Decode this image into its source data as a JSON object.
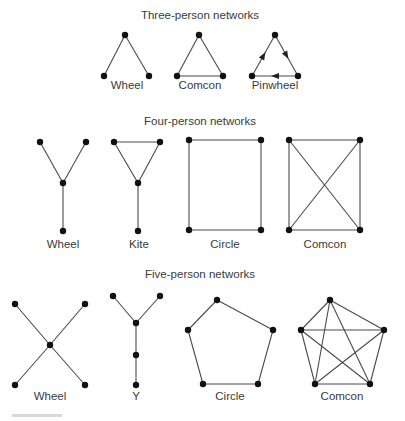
{
  "diagram": {
    "colors": {
      "edge": "#4a4a4a",
      "node": "#111111",
      "text": "#3a3a3a",
      "background": "#ffffff"
    },
    "sections": [
      {
        "id": "three",
        "title": "Three-person networks",
        "title_pos": [
          200,
          19
        ],
        "networks": [
          {
            "name": "Wheel",
            "label_pos": [
              127,
              89
            ],
            "nodes": [
              [
                125,
                35
              ],
              [
                104,
                76
              ],
              [
                149,
                76
              ]
            ],
            "edges": [
              [
                0,
                1
              ],
              [
                0,
                2
              ]
            ]
          },
          {
            "name": "Comcon",
            "label_pos": [
              200,
              89
            ],
            "nodes": [
              [
                199,
                35
              ],
              [
                177,
                76
              ],
              [
                223,
                76
              ]
            ],
            "edges": [
              [
                0,
                1
              ],
              [
                0,
                2
              ],
              [
                1,
                2
              ]
            ]
          },
          {
            "name": "Pinwheel",
            "label_pos": [
              275,
              89
            ],
            "nodes": [
              [
                275,
                35
              ],
              [
                252,
                76
              ],
              [
                298,
                76
              ]
            ],
            "edges": [
              [
                1,
                0
              ],
              [
                0,
                2
              ],
              [
                2,
                1
              ]
            ],
            "directed": true
          }
        ]
      },
      {
        "id": "four",
        "title": "Four-person networks",
        "title_pos": [
          200,
          125
        ],
        "networks": [
          {
            "name": "Wheel",
            "label_pos": [
              63,
              248
            ],
            "nodes": [
              [
                40,
                142
              ],
              [
                86,
                142
              ],
              [
                63,
                183
              ],
              [
                63,
                231
              ]
            ],
            "edges": [
              [
                0,
                2
              ],
              [
                1,
                2
              ],
              [
                2,
                3
              ]
            ]
          },
          {
            "name": "Kite",
            "label_pos": [
              139,
              248
            ],
            "nodes": [
              [
                114,
                142
              ],
              [
                160,
                142
              ],
              [
                138,
                183
              ],
              [
                138,
                231
              ]
            ],
            "edges": [
              [
                0,
                1
              ],
              [
                0,
                2
              ],
              [
                1,
                2
              ],
              [
                2,
                3
              ]
            ]
          },
          {
            "name": "Circle",
            "label_pos": [
              225,
              248
            ],
            "nodes": [
              [
                189,
                140
              ],
              [
                261,
                140
              ],
              [
                261,
                230
              ],
              [
                189,
                230
              ]
            ],
            "edges": [
              [
                0,
                1
              ],
              [
                1,
                2
              ],
              [
                2,
                3
              ],
              [
                3,
                0
              ]
            ]
          },
          {
            "name": "Comcon",
            "label_pos": [
              325,
              248
            ],
            "nodes": [
              [
                289,
                140
              ],
              [
                360,
                140
              ],
              [
                360,
                230
              ],
              [
                289,
                230
              ]
            ],
            "edges": [
              [
                0,
                1
              ],
              [
                1,
                2
              ],
              [
                2,
                3
              ],
              [
                3,
                0
              ],
              [
                0,
                2
              ],
              [
                1,
                3
              ]
            ]
          }
        ]
      },
      {
        "id": "five",
        "title": "Five-person networks",
        "title_pos": [
          200,
          278
        ],
        "networks": [
          {
            "name": "Wheel",
            "label_pos": [
              50,
              400
            ],
            "nodes": [
              [
                15,
                304
              ],
              [
                85,
                304
              ],
              [
                50,
                345
              ],
              [
                15,
                385
              ],
              [
                85,
                385
              ]
            ],
            "edges": [
              [
                0,
                2
              ],
              [
                1,
                2
              ],
              [
                3,
                2
              ],
              [
                4,
                2
              ]
            ]
          },
          {
            "name": "Y",
            "label_pos": [
              136,
              400
            ],
            "nodes": [
              [
                113,
                296
              ],
              [
                160,
                296
              ],
              [
                136,
                323
              ],
              [
                136,
                355
              ],
              [
                136,
                385
              ]
            ],
            "edges": [
              [
                0,
                2
              ],
              [
                1,
                2
              ],
              [
                2,
                3
              ],
              [
                3,
                4
              ]
            ]
          },
          {
            "name": "Circle",
            "label_pos": [
              230,
              400
            ],
            "nodes": [
              [
                217,
                300
              ],
              [
                188,
                330
              ],
              [
                273,
                330
              ],
              [
                258,
                384
              ],
              [
                203,
                384
              ]
            ],
            "edges": [
              [
                0,
                1
              ],
              [
                0,
                2
              ],
              [
                2,
                3
              ],
              [
                3,
                4
              ],
              [
                4,
                1
              ]
            ]
          },
          {
            "name": "Comcon",
            "label_pos": [
              342,
              400
            ],
            "nodes": [
              [
                330,
                300
              ],
              [
                301,
                330
              ],
              [
                384,
                330
              ],
              [
                370,
                384
              ],
              [
                315,
                384
              ]
            ],
            "edges": [
              [
                0,
                1
              ],
              [
                0,
                2
              ],
              [
                0,
                3
              ],
              [
                0,
                4
              ],
              [
                1,
                2
              ],
              [
                1,
                3
              ],
              [
                1,
                4
              ],
              [
                2,
                3
              ],
              [
                2,
                4
              ],
              [
                3,
                4
              ]
            ]
          }
        ]
      }
    ]
  }
}
